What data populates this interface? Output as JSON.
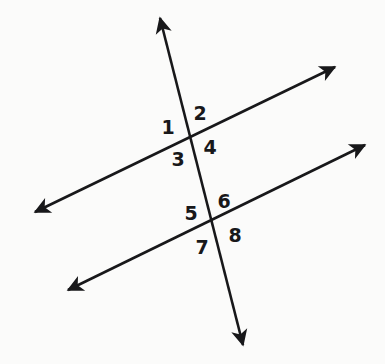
{
  "diagram": {
    "kind": "two-lines-cut-by-transversal",
    "background_color": "#fbfbfa",
    "stroke_color": "#18181a",
    "lines": [
      {
        "name": "transversal",
        "label": "transversal-line",
        "start": [
          160,
          18
        ],
        "end": [
          243,
          345
        ],
        "arrow_start": true,
        "arrow_end": true
      },
      {
        "name": "upper-parallel",
        "label": "upper-parallel-line",
        "start": [
          35,
          212
        ],
        "end": [
          335,
          67
        ],
        "arrow_start": true,
        "arrow_end": true
      },
      {
        "name": "lower-parallel",
        "label": "lower-parallel-line",
        "start": [
          68,
          290
        ],
        "end": [
          365,
          145
        ],
        "arrow_start": true,
        "arrow_end": true
      }
    ],
    "intersections": [
      {
        "name": "upper-intersection",
        "point": [
          190,
          137
        ]
      },
      {
        "name": "lower-intersection",
        "point": [
          213,
          226
        ]
      }
    ],
    "angle_labels": [
      {
        "id": "angle-1",
        "text": "1",
        "x": 168,
        "y": 127
      },
      {
        "id": "angle-2",
        "text": "2",
        "x": 200,
        "y": 113
      },
      {
        "id": "angle-3",
        "text": "3",
        "x": 178,
        "y": 159
      },
      {
        "id": "angle-4",
        "text": "4",
        "x": 210,
        "y": 147
      },
      {
        "id": "angle-5",
        "text": "5",
        "x": 191,
        "y": 213
      },
      {
        "id": "angle-6",
        "text": "6",
        "x": 224,
        "y": 201
      },
      {
        "id": "angle-7",
        "text": "7",
        "x": 202,
        "y": 247
      },
      {
        "id": "angle-8",
        "text": "8",
        "x": 235,
        "y": 235
      }
    ]
  }
}
